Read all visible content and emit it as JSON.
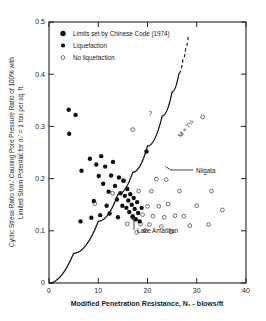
{
  "chart_data": {
    "type": "scatter",
    "title": "",
    "xlabel": "Modified Penetration Resistance, N₁ - blows/ft",
    "ylabel_line1": "Cyclic Stress Ratio τ/σᵥ' Causing Pore Pressure Ratio of 100% with",
    "ylabel_line2": "Limited Strain Potential for σᵥ' = 1 ton per sq. ft.",
    "xlim": [
      0,
      40
    ],
    "ylim": [
      0,
      0.5
    ],
    "xticks": [
      0,
      10,
      20,
      30,
      40
    ],
    "xtick_labels": [
      "0",
      "10",
      "20",
      "30",
      "40"
    ],
    "yticks": [
      0,
      0.1,
      0.2,
      0.3,
      0.4,
      0.5
    ],
    "ytick_labels": [
      "0",
      "0.1",
      "0.2",
      "0.3",
      "0.4",
      "0.5"
    ],
    "grid": false,
    "legend_position": "top-left",
    "legend": [
      {
        "key": "chinese-code",
        "marker": "filled-square-circle",
        "label": "Limits set by Chinese Code (1974)"
      },
      {
        "key": "liquefaction",
        "marker": "filled-circle",
        "label": "Liquefaction"
      },
      {
        "key": "no-liquefaction",
        "marker": "open-circle",
        "label": "No liquefaction"
      }
    ],
    "series": [
      {
        "name": "Liquefaction",
        "marker": "filled-circle",
        "points": [
          [
            4.0,
            0.332
          ],
          [
            5.4,
            0.322
          ],
          [
            4.1,
            0.286
          ],
          [
            6.6,
            0.215
          ],
          [
            8.3,
            0.238
          ],
          [
            9.6,
            0.227
          ],
          [
            10.1,
            0.205
          ],
          [
            10.6,
            0.243
          ],
          [
            11.0,
            0.19
          ],
          [
            11.4,
            0.223
          ],
          [
            12.1,
            0.175
          ],
          [
            12.6,
            0.206
          ],
          [
            13.0,
            0.232
          ],
          [
            13.4,
            0.186
          ],
          [
            13.8,
            0.16
          ],
          [
            14.2,
            0.202
          ],
          [
            14.5,
            0.172
          ],
          [
            14.9,
            0.148
          ],
          [
            15.1,
            0.196
          ],
          [
            15.4,
            0.167
          ],
          [
            15.7,
            0.144
          ],
          [
            15.9,
            0.18
          ],
          [
            16.1,
            0.158
          ],
          [
            16.3,
            0.136
          ],
          [
            16.5,
            0.17
          ],
          [
            16.8,
            0.15
          ],
          [
            17.0,
            0.128
          ],
          [
            17.2,
            0.163
          ],
          [
            17.4,
            0.142
          ],
          [
            17.6,
            0.122
          ],
          [
            17.9,
            0.155
          ],
          [
            18.1,
            0.134
          ],
          [
            18.4,
            0.118
          ],
          [
            8.6,
            0.125
          ],
          [
            10.4,
            0.13
          ],
          [
            12.3,
            0.133
          ],
          [
            6.4,
            0.118
          ],
          [
            9.1,
            0.157
          ],
          [
            19.8,
            0.252
          ],
          [
            18.8,
            0.144
          ],
          [
            14.0,
            0.126
          ],
          [
            11.7,
            0.148
          ]
        ]
      },
      {
        "name": "No liquefaction",
        "marker": "open-circle",
        "points": [
          [
            17.0,
            0.294
          ],
          [
            31.2,
            0.318
          ],
          [
            9.3,
            0.152
          ],
          [
            12.9,
            0.172
          ],
          [
            15.2,
            0.196
          ],
          [
            18.2,
            0.176
          ],
          [
            20.8,
            0.176
          ],
          [
            20.0,
            0.147
          ],
          [
            22.3,
            0.147
          ],
          [
            24.2,
            0.151
          ],
          [
            21.8,
            0.199
          ],
          [
            23.8,
            0.198
          ],
          [
            26.5,
            0.176
          ],
          [
            33.0,
            0.176
          ],
          [
            19.0,
            0.131
          ],
          [
            21.1,
            0.128
          ],
          [
            23.4,
            0.126
          ],
          [
            25.6,
            0.129
          ],
          [
            18.6,
            0.113
          ],
          [
            20.4,
            0.112
          ],
          [
            16.9,
            0.126
          ],
          [
            15.9,
            0.113
          ],
          [
            22.8,
            0.108
          ],
          [
            27.4,
            0.128
          ],
          [
            30.0,
            0.148
          ],
          [
            35.2,
            0.14
          ],
          [
            28.6,
            0.11
          ],
          [
            32.4,
            0.112
          ],
          [
            17.8,
            0.097
          ],
          [
            19.6,
            0.1
          ],
          [
            24.8,
            0.098
          ]
        ]
      }
    ],
    "curves": [
      {
        "name": "M = 7 1/2 boundary (solid)",
        "style": "solid",
        "points": [
          [
            0.0,
            0.0
          ],
          [
            5.0,
            0.057
          ],
          [
            10.0,
            0.118
          ],
          [
            14.0,
            0.17
          ],
          [
            17.0,
            0.212
          ],
          [
            20.0,
            0.262
          ],
          [
            23.0,
            0.32
          ],
          [
            25.0,
            0.366
          ],
          [
            26.4,
            0.402
          ]
        ]
      },
      {
        "name": "M = 7 1/2 boundary (dashed extension)",
        "style": "dashed",
        "points": [
          [
            26.4,
            0.402
          ],
          [
            27.2,
            0.428
          ],
          [
            27.8,
            0.452
          ],
          [
            28.3,
            0.474
          ]
        ]
      }
    ],
    "annotations": [
      {
        "key": "niigata",
        "text": "Niigata",
        "x": 19.8,
        "y": 0.252
      },
      {
        "key": "lake-amatitlan",
        "text": "Lake Amatitlan",
        "x": 17.4,
        "y": 0.142
      },
      {
        "key": "question-mark",
        "text": "?",
        "x": 17.0,
        "y": 0.31
      },
      {
        "key": "magnitude-label",
        "text": "M ≈ 7½",
        "x": 22.0,
        "y": 0.3
      }
    ]
  }
}
